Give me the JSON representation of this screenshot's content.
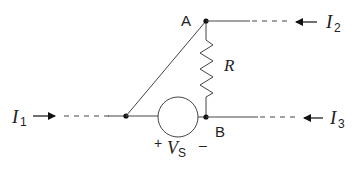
{
  "diagram": {
    "type": "circuit",
    "nodes": {
      "A": {
        "label": "A"
      },
      "B": {
        "label": "B"
      }
    },
    "resistor": {
      "label": "R"
    },
    "source": {
      "label_main": "V",
      "label_sub": "S",
      "plus": "+",
      "minus": "–"
    },
    "currents": [
      {
        "main": "I",
        "sub": "1",
        "direction": "right"
      },
      {
        "main": "I",
        "sub": "2",
        "direction": "left"
      },
      {
        "main": "I",
        "sub": "3",
        "direction": "left"
      }
    ],
    "colors": {
      "wire": "#444444",
      "text": "#222222",
      "background": "#ffffff"
    }
  }
}
